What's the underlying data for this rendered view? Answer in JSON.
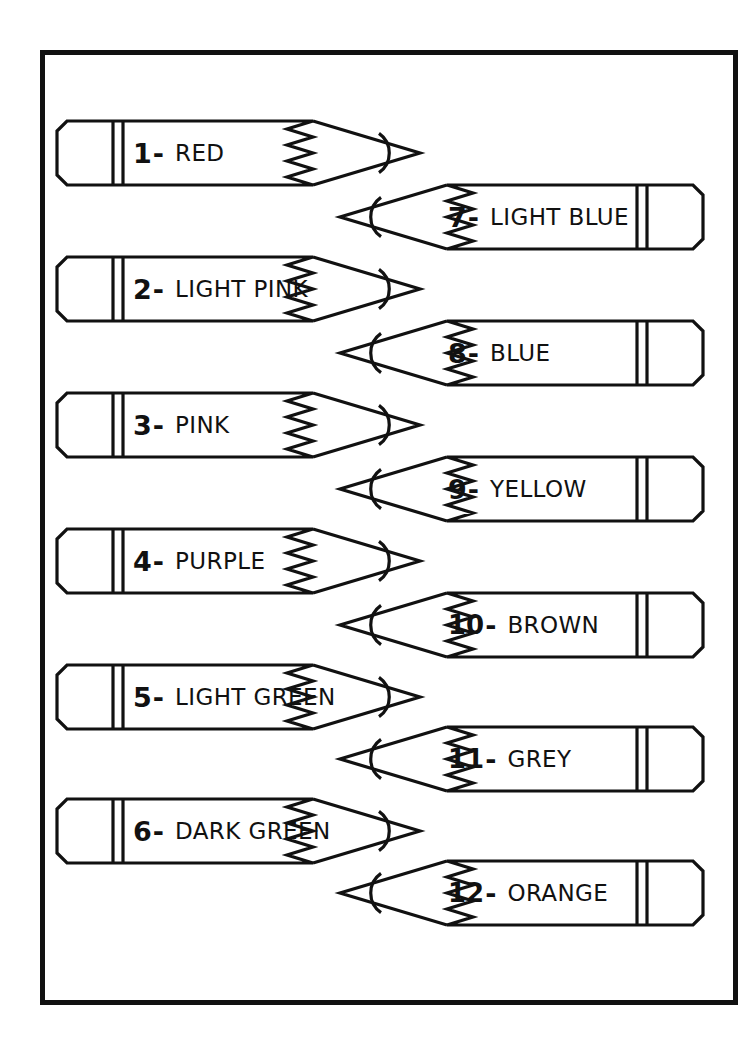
{
  "page": {
    "background_color": "#ffffff",
    "ink_color": "#111111",
    "border_color": "#111111"
  },
  "frame": {
    "x": 40,
    "y": 50,
    "width": 698,
    "height": 955,
    "stroke": 5
  },
  "pencils": [
    {
      "number": "1",
      "dash": "-",
      "name": "RED",
      "side": "left",
      "row": 0
    },
    {
      "number": "2",
      "dash": "-",
      "name": "LIGHT PINK",
      "side": "left",
      "row": 1
    },
    {
      "number": "3",
      "dash": "-",
      "name": "PINK",
      "side": "left",
      "row": 2
    },
    {
      "number": "4",
      "dash": "-",
      "name": "PURPLE",
      "side": "left",
      "row": 3
    },
    {
      "number": "5",
      "dash": "-",
      "name": "LIGHT GREEN",
      "side": "left",
      "row": 4
    },
    {
      "number": "6",
      "dash": "-",
      "name": "DARK GREEN",
      "side": "left",
      "row": 5
    },
    {
      "number": "7",
      "dash": "-",
      "name": "LIGHT BLUE",
      "side": "right",
      "row": 0
    },
    {
      "number": "8",
      "dash": "-",
      "name": "BLUE",
      "side": "right",
      "row": 1
    },
    {
      "number": "9",
      "dash": "-",
      "name": "YELLOW",
      "side": "right",
      "row": 2
    },
    {
      "number": "10",
      "dash": "-",
      "name": "BROWN",
      "side": "right",
      "row": 3
    },
    {
      "number": "11",
      "dash": "-",
      "name": "GREY",
      "side": "right",
      "row": 4
    },
    {
      "number": "12",
      "dash": "-",
      "name": "ORANGE",
      "side": "right",
      "row": 5
    }
  ],
  "layout": {
    "left_pencil_x": 55,
    "right_pencil_x": 340,
    "left_rows_y": [
      118,
      254,
      390,
      526,
      662,
      796
    ],
    "right_rows_y": [
      182,
      318,
      454,
      590,
      724,
      858
    ],
    "pencil_width": 365,
    "pencil_height": 70
  }
}
